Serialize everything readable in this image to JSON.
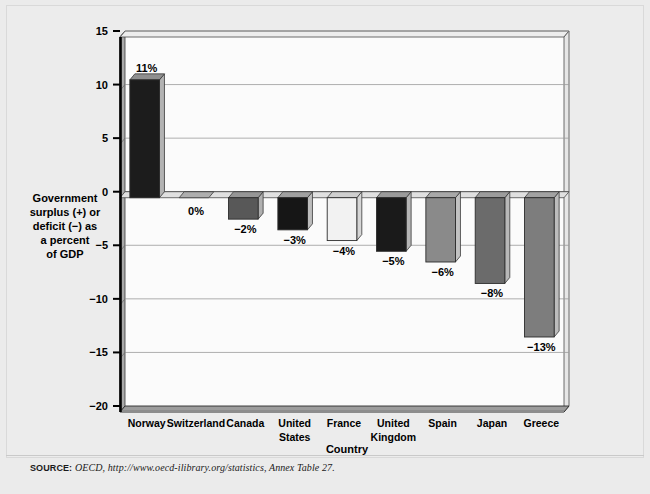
{
  "figure": {
    "source_label": "SOURCE:",
    "source_text": "OECD, http://www.oecd-ilibrary.org/statistics, Annex Table 27."
  },
  "chart_data": {
    "type": "bar",
    "title": "",
    "subtitle": "",
    "xlabel": "Country",
    "ylabel": "Government surplus (+) or deficit (−) as a percent of GDP",
    "ylabel_lines": [
      "Government",
      "surplus (+) or",
      "deficit (−) as",
      "a percent",
      "of GDP"
    ],
    "categories": [
      "Norway",
      "Switzerland",
      "Canada",
      "United States",
      "France",
      "United Kingdom",
      "Spain",
      "Japan",
      "Greece"
    ],
    "category_lines": [
      [
        "Norway"
      ],
      [
        "Switzerland"
      ],
      [
        "Canada"
      ],
      [
        "United",
        "States"
      ],
      [
        "France"
      ],
      [
        "United",
        "Kingdom"
      ],
      [
        "Spain"
      ],
      [
        "Japan"
      ],
      [
        "Greece"
      ]
    ],
    "values": [
      11,
      0,
      -2,
      -3,
      -4,
      -5,
      -6,
      -8,
      -13
    ],
    "data_labels": [
      "11%",
      "0%",
      "−2%",
      "−3%",
      "−4%",
      "−5%",
      "−6%",
      "−8%",
      "−13%"
    ],
    "bar_colors": [
      "#1c1c1c",
      "#c9c9c9",
      "#585858",
      "#161616",
      "#f2f2f2",
      "#1a1a1a",
      "#8a8a8a",
      "#6b6b6b",
      "#7d7d7d"
    ],
    "bar_side_colors": [
      "#b3b3b3",
      "#9e9e9e",
      "#b0b0b0",
      "#bdbdbd",
      "#d6d6d6",
      "#b5b5b5",
      "#c2c2c2",
      "#b8b8b8",
      "#bcbcbc"
    ],
    "bar_top_colors": [
      "#8f8f8f",
      "#aeaeae",
      "#969696",
      "#a0a0a0",
      "#cfcfcf",
      "#9a9a9a",
      "#a8a8a8",
      "#9c9c9c",
      "#a2a2a2"
    ],
    "ylim": [
      -20,
      15
    ],
    "yticks": [
      15,
      10,
      5,
      0,
      -5,
      -10,
      -15,
      -20
    ],
    "ytick_labels": [
      "15",
      "10",
      "5",
      "0",
      "−5",
      "−10",
      "−15",
      "−20"
    ],
    "grid": true,
    "legend": "none",
    "units": "percent of GDP"
  },
  "colors": {
    "plot_background": "#fbfbfb",
    "wall_left": "#a8a8a8",
    "wall_back_shade": "#e3e3e3",
    "floor": "#9a9a9a",
    "gridline": "#9a9a9a",
    "axis": "#000000",
    "page_background": "#ebebeb"
  }
}
